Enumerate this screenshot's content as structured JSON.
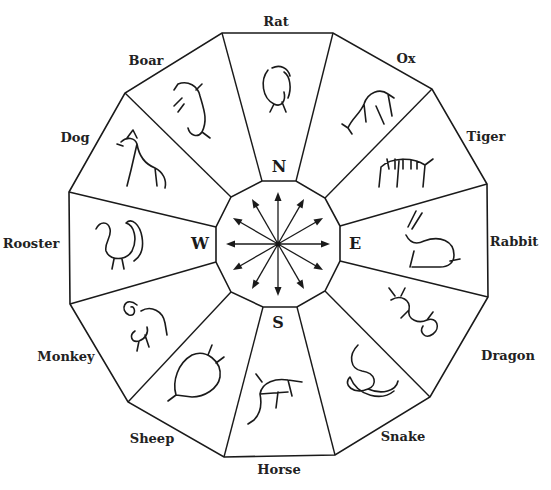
{
  "diagram": {
    "type": "zodiac-compass-wheel",
    "center": [
      278,
      244
    ],
    "colors": {
      "line": "#1a1a1a",
      "background": "#ffffff",
      "text": "#222222"
    },
    "outer_vertices": [
      [
        222,
        33
      ],
      [
        333,
        33
      ],
      [
        432,
        89
      ],
      [
        487,
        184
      ],
      [
        488,
        297
      ],
      [
        430,
        397
      ],
      [
        335,
        455
      ],
      [
        224,
        457
      ],
      [
        128,
        402
      ],
      [
        70,
        304
      ],
      [
        69,
        192
      ],
      [
        125,
        93
      ]
    ],
    "inner_vertices": [
      [
        262,
        181
      ],
      [
        296,
        181
      ],
      [
        325,
        198
      ],
      [
        340,
        226
      ],
      [
        340,
        261
      ],
      [
        325,
        291
      ],
      [
        297,
        307
      ],
      [
        263,
        307
      ],
      [
        231,
        292
      ],
      [
        216,
        262
      ],
      [
        216,
        227
      ],
      [
        231,
        197
      ]
    ],
    "directions": [
      {
        "letter": "N",
        "x": 279,
        "y": 166
      },
      {
        "letter": "E",
        "x": 355,
        "y": 243
      },
      {
        "letter": "S",
        "x": 278,
        "y": 322
      },
      {
        "letter": "W",
        "x": 200,
        "y": 243
      }
    ],
    "animals": [
      {
        "name": "Rat",
        "label_x": 276,
        "label_y": 21,
        "icon": "rat-icon",
        "art_x": 280,
        "art_y": 90
      },
      {
        "name": "Ox",
        "label_x": 406,
        "label_y": 58,
        "icon": "ox-icon",
        "art_x": 370,
        "art_y": 110
      },
      {
        "name": "Tiger",
        "label_x": 486,
        "label_y": 136,
        "icon": "tiger-icon",
        "art_x": 405,
        "art_y": 175
      },
      {
        "name": "Rabbit",
        "label_x": 514,
        "label_y": 241,
        "icon": "rabbit-icon",
        "art_x": 430,
        "art_y": 245
      },
      {
        "name": "Dragon",
        "label_x": 508,
        "label_y": 355,
        "icon": "dragon-icon",
        "art_x": 415,
        "art_y": 318
      },
      {
        "name": "Snake",
        "label_x": 403,
        "label_y": 436,
        "icon": "snake-icon",
        "art_x": 368,
        "art_y": 375
      },
      {
        "name": "Horse",
        "label_x": 279,
        "label_y": 469,
        "icon": "horse-icon",
        "art_x": 278,
        "art_y": 400
      },
      {
        "name": "Sheep",
        "label_x": 152,
        "label_y": 438,
        "icon": "sheep-icon",
        "art_x": 198,
        "art_y": 375
      },
      {
        "name": "Monkey",
        "label_x": 66,
        "label_y": 356,
        "icon": "monkey-icon",
        "art_x": 145,
        "art_y": 325
      },
      {
        "name": "Rooster",
        "label_x": 31,
        "label_y": 243,
        "icon": "rooster-icon",
        "art_x": 120,
        "art_y": 243
      },
      {
        "name": "Dog",
        "label_x": 75,
        "label_y": 137,
        "icon": "dog-icon",
        "art_x": 145,
        "art_y": 160
      },
      {
        "name": "Boar",
        "label_x": 146,
        "label_y": 60,
        "icon": "boar-icon",
        "art_x": 198,
        "art_y": 110
      }
    ],
    "arrow_count": 12,
    "arrow_length": 52
  }
}
